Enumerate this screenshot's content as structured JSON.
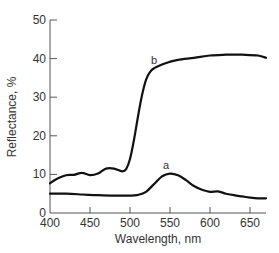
{
  "chart_data": {
    "type": "line",
    "title": "",
    "xlabel": "Wavelength, nm",
    "ylabel": "Reflectance, %",
    "xlim": [
      400,
      670
    ],
    "ylim": [
      0,
      50
    ],
    "xticks": [
      400,
      450,
      500,
      550,
      600,
      650
    ],
    "yticks": [
      0,
      10,
      20,
      30,
      40,
      50
    ],
    "grid": false,
    "legend": "none (curves labeled inline)",
    "series": [
      {
        "name": "a",
        "x": [
          400,
          420,
          440,
          460,
          480,
          500,
          510,
          520,
          530,
          540,
          550,
          560,
          570,
          580,
          590,
          600,
          610,
          620,
          630,
          640,
          650,
          660,
          670
        ],
        "values": [
          5.0,
          5.0,
          4.8,
          4.6,
          4.5,
          4.5,
          4.7,
          5.5,
          7.5,
          9.5,
          10.2,
          9.8,
          8.5,
          7.0,
          6.0,
          5.5,
          5.6,
          5.0,
          4.6,
          4.3,
          4.0,
          3.8,
          3.8
        ]
      },
      {
        "name": "b",
        "x": [
          400,
          410,
          420,
          430,
          440,
          450,
          460,
          470,
          480,
          490,
          495,
          500,
          505,
          510,
          515,
          520,
          525,
          530,
          540,
          550,
          560,
          580,
          600,
          620,
          640,
          660,
          670
        ],
        "values": [
          7.7,
          9.0,
          9.8,
          9.9,
          10.4,
          9.8,
          10.2,
          11.5,
          11.5,
          10.8,
          11.3,
          14.0,
          19.0,
          25.0,
          30.5,
          34.5,
          36.5,
          37.5,
          38.5,
          39.2,
          39.7,
          40.2,
          40.8,
          41.0,
          41.0,
          40.8,
          40.2
        ]
      }
    ],
    "annotations": [
      {
        "text": "a",
        "x": 545,
        "y": 11.5
      },
      {
        "text": "b",
        "x": 530,
        "y": 38.5
      }
    ]
  }
}
